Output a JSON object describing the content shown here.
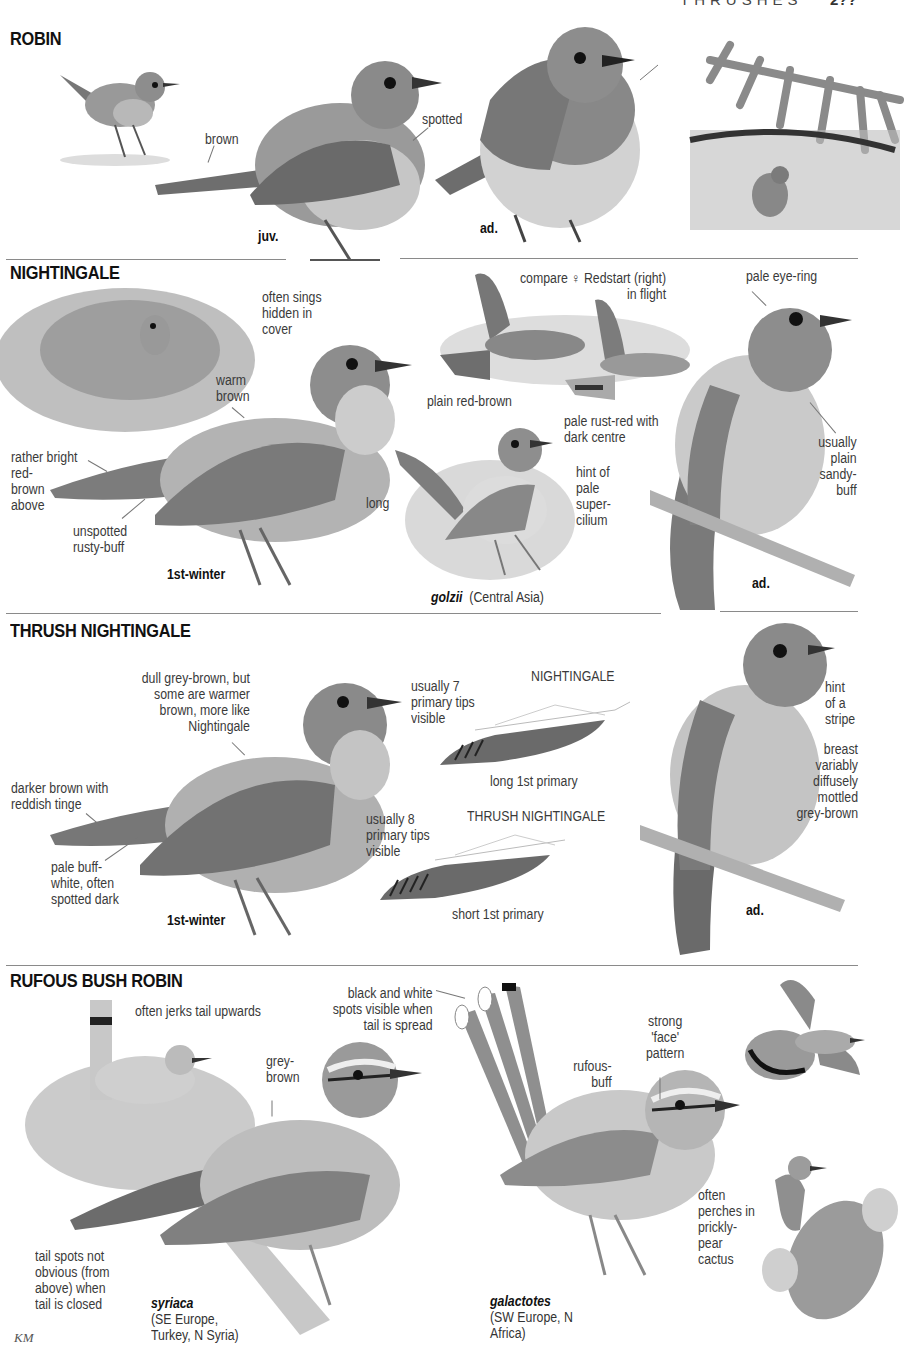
{
  "header": {
    "running_title": "THRUSHES",
    "page_number": "2??"
  },
  "sections": {
    "robin": {
      "title": "ROBIN",
      "labels": {
        "brown": "brown",
        "spotted": "spotted"
      },
      "ages": {
        "juv": "juv.",
        "ad": "ad."
      }
    },
    "nightingale": {
      "title": "NIGHTINGALE",
      "labels": {
        "sings_hidden": [
          "often sings",
          "hidden in",
          "cover"
        ],
        "warm_brown": [
          "warm",
          "brown"
        ],
        "red_brown_above": [
          "rather bright",
          "red-",
          "brown",
          "above"
        ],
        "unspotted": [
          "unspotted",
          "rusty-buff"
        ],
        "compare_redstart": [
          "compare ♀ Redstart (right)",
          "in flight"
        ],
        "plain_red_brown": "plain red-brown",
        "pale_rust_red": [
          "pale rust-red with",
          "dark centre"
        ],
        "long": "long",
        "supercilium": [
          "hint of",
          "pale",
          "super-",
          "cilium"
        ],
        "pale_eye_ring": "pale eye-ring",
        "sandy_buff": [
          "usually",
          "plain",
          "sandy-",
          "buff"
        ]
      },
      "ages": {
        "first_winter": "1st-winter",
        "ad": "ad."
      },
      "subspecies": {
        "name": "golzii",
        "range": "(Central Asia)"
      }
    },
    "thrush_nightingale": {
      "title": "THRUSH NIGHTINGALE",
      "labels": {
        "dull_grey_brown": [
          "dull grey-brown, but",
          "some are warmer",
          "brown, more like",
          "Nightingale"
        ],
        "darker_brown": [
          "darker brown with",
          "reddish tinge"
        ],
        "pale_buff_white": [
          "pale buff-",
          "white, often",
          "spotted dark"
        ],
        "seven_tips": [
          "usually 7",
          "primary tips",
          "visible"
        ],
        "nightingale_wing": "NIGHTINGALE",
        "long_first_primary": "long 1st primary",
        "eight_tips": [
          "usually 8",
          "primary tips",
          "visible"
        ],
        "thrush_nightingale_wing": "THRUSH NIGHTINGALE",
        "short_first_primary": "short 1st primary",
        "hint_stripe": [
          "hint",
          "of a",
          "stripe"
        ],
        "breast_mottled": [
          "breast",
          "variably",
          "diffusely",
          "mottled",
          "grey-brown"
        ]
      },
      "ages": {
        "first_winter": "1st-winter",
        "ad": "ad."
      }
    },
    "rufous_bush_robin": {
      "title": "RUFOUS BUSH ROBIN",
      "labels": {
        "jerks_tail": "often jerks tail upwards",
        "tail_spots_spread": [
          "black and white",
          "spots visible when",
          "tail is spread"
        ],
        "grey_brown": [
          "grey-",
          "brown"
        ],
        "rufous_buff": [
          "rufous-",
          "buff"
        ],
        "strong_face": [
          "strong",
          "'face'",
          "pattern"
        ],
        "tail_spots_closed": [
          "tail spots not",
          "obvious (from",
          "above) when",
          "tail is closed"
        ],
        "prickly_pear": [
          "often",
          "perches in",
          "prickly-",
          "pear",
          "cactus"
        ]
      },
      "subspecies": [
        {
          "name": "syriaca",
          "range": [
            "(SE Europe,",
            "Turkey, N Syria)"
          ]
        },
        {
          "name": "galactotes",
          "range": [
            "(SW Europe, N",
            "Africa)"
          ]
        }
      ]
    }
  },
  "credit": "KM",
  "colors": {
    "ink": "#111111",
    "label": "#3a3a3a",
    "rule": "#8a8a8a",
    "bird_dark": "#5a5a5a",
    "bird_mid": "#8c8c8c",
    "bird_light": "#cfcfcf"
  }
}
